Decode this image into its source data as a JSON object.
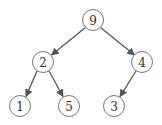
{
  "diagram": {
    "type": "binary-tree",
    "colors": {
      "edge": "#555555",
      "node_stroke": "#777777",
      "node_fill": "#ffffff",
      "label": "#333333"
    },
    "node_radius": 10.5,
    "nodes": [
      {
        "id": "n9",
        "label": "9",
        "x": 93,
        "y": 20
      },
      {
        "id": "n2",
        "label": "2",
        "x": 43,
        "y": 62
      },
      {
        "id": "n4",
        "label": "4",
        "x": 142,
        "y": 62
      },
      {
        "id": "n1",
        "label": "1",
        "x": 20,
        "y": 106
      },
      {
        "id": "n5",
        "label": "5",
        "x": 69,
        "y": 106
      },
      {
        "id": "n3",
        "label": "3",
        "x": 114,
        "y": 106
      }
    ],
    "edges": [
      {
        "from": "n9",
        "to": "n2"
      },
      {
        "from": "n9",
        "to": "n4"
      },
      {
        "from": "n2",
        "to": "n1"
      },
      {
        "from": "n2",
        "to": "n5"
      },
      {
        "from": "n4",
        "to": "n3"
      }
    ]
  }
}
